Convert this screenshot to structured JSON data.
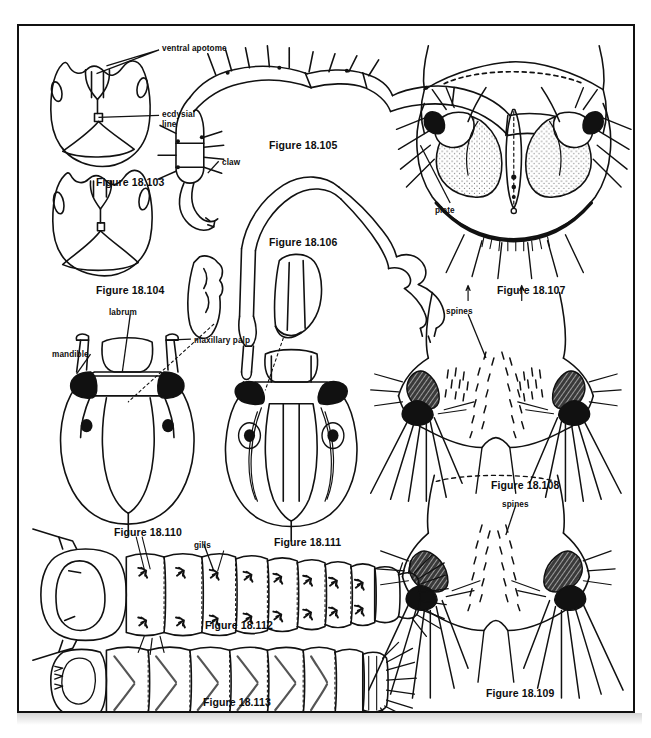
{
  "page": {
    "running_head": "",
    "width": 651,
    "height": 738,
    "background_color": "#ffffff",
    "ink_color": "#111111"
  },
  "plate": {
    "border_color": "#111111",
    "figures": [
      {
        "id": "18.103",
        "caption": "Figure 18.103",
        "subject": "larval head capsule, ventral view",
        "x": 77,
        "y": 150
      },
      {
        "id": "18.104",
        "caption": "Figure 18.104",
        "subject": "larval head capsule, ventral view",
        "x": 77,
        "y": 258
      },
      {
        "id": "18.105",
        "caption": "Figure 18.105",
        "subject": "larval leg with claw",
        "x": 250,
        "y": 113
      },
      {
        "id": "18.106",
        "caption": "Figure 18.106",
        "subject": "larval leg",
        "x": 250,
        "y": 210
      },
      {
        "id": "18.107",
        "caption": "Figure 18.107",
        "subject": "larval abdominal segment with plate",
        "x": 478,
        "y": 258
      },
      {
        "id": "18.108",
        "caption": "Figure 18.108",
        "subject": "larval abdominal segment with spines",
        "x": 472,
        "y": 453
      },
      {
        "id": "18.109",
        "caption": "Figure 18.109",
        "subject": "larval abdominal segment with spines",
        "x": 467,
        "y": 684
      },
      {
        "id": "18.110",
        "caption": "Figure 18.110",
        "subject": "larval head, dorsal view",
        "x": 113,
        "y": 507
      },
      {
        "id": "18.111",
        "caption": "Figure 18.111",
        "subject": "larval head, dorsal view",
        "x": 272,
        "y": 516
      },
      {
        "id": "18.112",
        "caption": "Figure 18.112",
        "subject": "whole larva with gills",
        "x": 202,
        "y": 602
      },
      {
        "id": "18.113",
        "caption": "Figure 18.113",
        "subject": "whole larva",
        "x": 200,
        "y": 679
      }
    ],
    "part_labels": [
      {
        "text": "ventral apotome",
        "x": 160,
        "y": 43,
        "leader_to": "apotome of fig 18.103"
      },
      {
        "text": "ecdysial",
        "x": 160,
        "y": 108,
        "leader_to": "ecdysial line of fig 18.103"
      },
      {
        "text": "line",
        "x": 160,
        "y": 117,
        "leader_to": "ecdysial line of fig 18.103"
      },
      {
        "text": "claw",
        "x": 218,
        "y": 156,
        "leader_to": "claw tip of fig 18.105"
      },
      {
        "text": "plate",
        "x": 433,
        "y": 206,
        "leader_to": "plate of fig 18.107"
      },
      {
        "text": "labrum",
        "x": 105,
        "y": 306,
        "leader_to": "labrum of fig 18.110"
      },
      {
        "text": "maxillary palp",
        "x": 190,
        "y": 334,
        "leader_to": "maxillary palp of fig 18.110"
      },
      {
        "text": "mandible",
        "x": 51,
        "y": 348,
        "leader_to": "mandible of fig 18.110"
      },
      {
        "text": "spines",
        "x": 444,
        "y": 305,
        "leader_to": "spine patch of fig 18.108"
      },
      {
        "text": "spines",
        "x": 500,
        "y": 498,
        "leader_to": "spine patch of fig 18.109"
      },
      {
        "text": "gills",
        "x": 189,
        "y": 524,
        "leader_to": "gill tufts of fig 18.112"
      }
    ]
  }
}
